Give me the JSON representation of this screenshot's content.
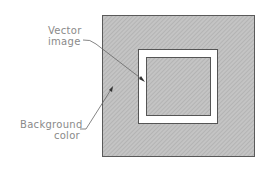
{
  "labels": {
    "vector_line1": "Vector",
    "vector_line2": "image",
    "bg_line1": "Background",
    "bg_line2": "color"
  },
  "colors": {
    "background_fill": "#bdbdbd",
    "border": "#5a5a5a",
    "frame": "#ffffff",
    "text": "#8a8a8a"
  }
}
